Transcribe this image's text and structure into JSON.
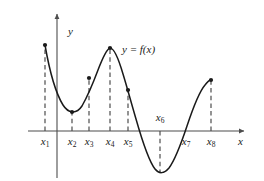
{
  "figure": {
    "curve_label": "y = f(x)",
    "axis_labels": {
      "x": "x",
      "y": "y"
    },
    "colors": {
      "curve": "#1a1a1a",
      "axis": "#4d4d4d",
      "dashed": "#4d4d4d",
      "dot": "#1a1a1a",
      "background": "#ffffff"
    }
  },
  "chart_data": {
    "type": "line",
    "title": "",
    "xlabel": "x",
    "ylabel": "y",
    "series_label": "y = f(x)",
    "grid": false,
    "legend": "none",
    "axis_origin": {
      "x": 57,
      "y": 131
    },
    "x_axis_range": [
      28,
      248
    ],
    "y_axis_range": [
      12,
      181
    ],
    "marked_points": [
      {
        "name": "x1",
        "label": "x",
        "subscript": "1",
        "x": 45,
        "y": 45,
        "label_side": "below",
        "dot": true,
        "dashed": true
      },
      {
        "name": "x2",
        "label": "x",
        "subscript": "2",
        "x": 72,
        "y": 112,
        "label_side": "below",
        "dot": true,
        "dashed": true
      },
      {
        "name": "x3",
        "label": "x",
        "subscript": "3",
        "x": 89,
        "y": 78,
        "label_side": "below",
        "dot": true,
        "dashed": true
      },
      {
        "name": "x4",
        "label": "x",
        "subscript": "4",
        "x": 110,
        "y": 48,
        "label_side": "below",
        "dot": true,
        "dashed": true
      },
      {
        "name": "x5",
        "label": "x",
        "subscript": "5",
        "x": 128,
        "y": 90,
        "label_side": "below",
        "dot": true,
        "dashed": true
      },
      {
        "name": "x6",
        "label": "x",
        "subscript": "6",
        "x": 160,
        "y": 172,
        "label_side": "above",
        "dot": false,
        "dashed": true
      },
      {
        "name": "x7",
        "label": "x",
        "subscript": "7",
        "x": 186,
        "y": 131,
        "label_side": "below",
        "dot": false,
        "dashed": false
      },
      {
        "name": "x8",
        "label": "x",
        "subscript": "8",
        "x": 211,
        "y": 80,
        "label_side": "below",
        "dot": true,
        "dashed": true
      }
    ],
    "curve_path": "M 45 45 C 49 68, 55 92, 63 105 C 68 113, 76 115, 82 106 C 86 99, 92 86, 98 70 C 103 57, 107 49, 110 48 C 114 48, 118 57, 123 74 C 127 87, 131 102, 136 119 C 142 140, 148 160, 155 169 C 159 174, 164 174, 169 168 C 175 160, 181 144, 187 126 C 193 108, 199 92, 205 85 C 208 81, 210 80, 211 80",
    "curve_label_position": {
      "x": 122,
      "y": 50
    }
  }
}
